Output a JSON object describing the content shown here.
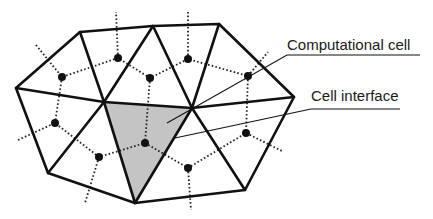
{
  "diagram": {
    "type": "unstructured triangular mesh with dual (cell-centered) graph",
    "labels": {
      "computational_cell": "Computational cell",
      "cell_interface": "Cell interface"
    },
    "colors": {
      "edge": "#111111",
      "shaded_cell": "#c4c4c4",
      "background": "#ffffff"
    },
    "legend": [
      {
        "label": "Computational cell",
        "marks": "shaded triangle"
      },
      {
        "label": "Cell interface",
        "marks": "triangle edge"
      }
    ],
    "mesh": {
      "vertex_count": 10,
      "triangle_count": 10,
      "shaded_triangle_count": 1
    }
  }
}
